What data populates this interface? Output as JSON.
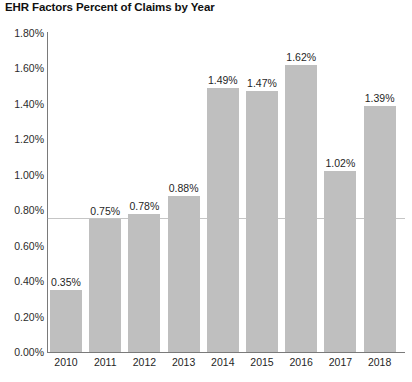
{
  "chart_data": {
    "type": "bar",
    "title": "EHR Factors Percent of Claims by Year",
    "xlabel": "",
    "ylabel": "",
    "categories": [
      "2010",
      "2011",
      "2012",
      "2013",
      "2014",
      "2015",
      "2016",
      "2017",
      "2018"
    ],
    "values": [
      0.35,
      0.75,
      0.78,
      0.88,
      1.49,
      1.47,
      1.62,
      1.02,
      1.39
    ],
    "value_labels": [
      "0.35%",
      "0.75%",
      "0.78%",
      "0.88%",
      "1.49%",
      "1.47%",
      "1.62%",
      "1.02%",
      "1.39%"
    ],
    "ylim": [
      0,
      1.8
    ],
    "y_tick_values": [
      0.0,
      0.2,
      0.4,
      0.6,
      0.8,
      1.0,
      1.2,
      1.4,
      1.6,
      1.8
    ],
    "y_tick_labels": [
      "0.00%",
      "0.20%",
      "0.40%",
      "0.60%",
      "0.80%",
      "1.00%",
      "1.20%",
      "1.40%",
      "1.60%",
      "1.80%"
    ],
    "grid": false,
    "legend": false,
    "series": [
      {
        "name": "EHR Factors Percent of Claims",
        "values": [
          0.35,
          0.75,
          0.78,
          0.88,
          1.49,
          1.47,
          1.62,
          1.02,
          1.39
        ]
      }
    ],
    "bar_color": "#bfbfbf",
    "axis_color": "#7a7a7a",
    "background_color": "#ffffff",
    "text_color": "#1f1f1f"
  }
}
